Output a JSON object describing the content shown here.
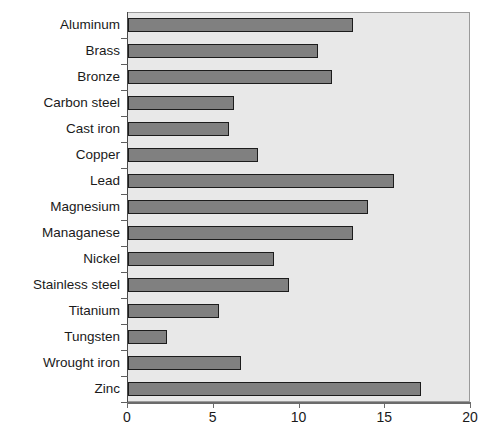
{
  "chart_data": {
    "type": "bar",
    "orientation": "horizontal",
    "title": "",
    "xlabel": "",
    "ylabel": "",
    "xlim": [
      0,
      20
    ],
    "xticks": [
      0,
      5,
      10,
      15,
      20
    ],
    "xtick_labels": [
      "0",
      "5",
      "10",
      "15",
      "20"
    ],
    "grid": false,
    "legend": false,
    "plot_background": "#e8e8e8",
    "bar_fill": "#808080",
    "bar_edge": "#1c1c1c",
    "categories": [
      "Aluminum",
      "Brass",
      "Bronze",
      "Carbon steel",
      "Cast iron",
      "Copper",
      "Lead",
      "Magnesium",
      "Managanese",
      "Nickel",
      "Stainless steel",
      "Titanium",
      "Tungsten",
      "Wrought iron",
      "Zinc"
    ],
    "values": [
      13.1,
      11.1,
      11.9,
      6.2,
      5.9,
      7.6,
      15.5,
      14.0,
      13.1,
      8.5,
      9.4,
      5.3,
      2.3,
      6.6,
      17.1
    ]
  },
  "caption": {
    "text": ""
  }
}
